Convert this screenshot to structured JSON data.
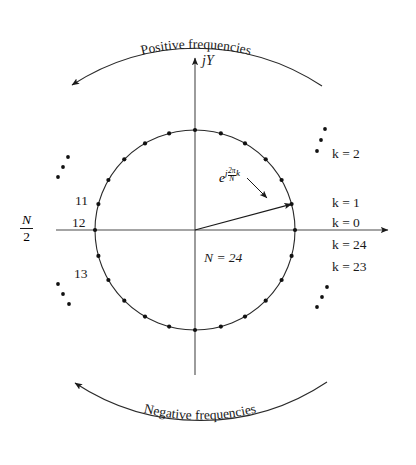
{
  "figure": {
    "title_top": "Positive frequencies",
    "title_bottom": "Negative frequencies",
    "axis_vertical_label": "jY",
    "axis_horizontal_label": "",
    "n_label": "N = 24",
    "half_label_num": "N",
    "half_label_den": "2",
    "vector_label": {
      "base": "e",
      "exp_j": "j",
      "exp_num": "2π",
      "exp_den": "N",
      "exp_k": "k"
    },
    "ellipsis_glyph": "•"
  },
  "chart_data": {
    "type": "scatter",
    "title": "Positive frequencies",
    "subtitle": "Negative frequencies",
    "xlabel": "",
    "ylabel": "jY",
    "N": 24,
    "radius": 1,
    "annotations": [
      "N = 24",
      "e^{j(2π/N)k}",
      "N/2"
    ],
    "point_labels_right": [
      {
        "k": 2,
        "text": "k = 2"
      },
      {
        "k": 1,
        "text": "k = 1"
      },
      {
        "k": 0,
        "text": "k = 0"
      },
      {
        "k": 24,
        "text": "k = 24"
      },
      {
        "k": 23,
        "text": "k = 23"
      }
    ],
    "point_labels_left": [
      {
        "k": 11,
        "text": "11"
      },
      {
        "k": 12,
        "text": "12"
      },
      {
        "k": 13,
        "text": "13"
      }
    ],
    "vector_points_to_k": 1,
    "angles_deg": [
      0,
      15,
      30,
      45,
      60,
      75,
      90,
      105,
      120,
      135,
      150,
      165,
      180,
      195,
      210,
      225,
      240,
      255,
      270,
      285,
      300,
      315,
      330,
      345
    ],
    "x": [
      1,
      0.966,
      0.866,
      0.707,
      0.5,
      0.259,
      0,
      -0.259,
      -0.5,
      -0.707,
      -0.866,
      -0.966,
      -1,
      -0.966,
      -0.866,
      -0.707,
      -0.5,
      -0.259,
      0,
      0.259,
      0.5,
      0.707,
      0.866,
      0.966
    ],
    "y": [
      0,
      0.259,
      0.5,
      0.707,
      0.866,
      0.966,
      1,
      0.966,
      0.866,
      0.707,
      0.5,
      0.259,
      0,
      -0.259,
      -0.5,
      -0.707,
      -0.866,
      -0.966,
      -1,
      -0.966,
      -0.866,
      -0.707,
      -0.5,
      -0.259
    ],
    "grid": false,
    "legend": "none"
  },
  "labels": {
    "k0": "k = 0",
    "k1": "k = 1",
    "k2": "k = 2",
    "k23": "k = 23",
    "k24": "k = 24",
    "i11": "11",
    "i12": "12",
    "i13": "13"
  }
}
